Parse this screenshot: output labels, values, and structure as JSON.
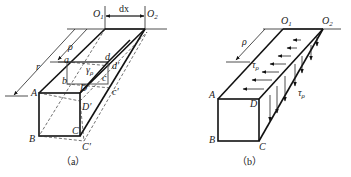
{
  "figure_a": {
    "caption": "（a）",
    "labels": {
      "O1": "O",
      "O1_sub": "1",
      "O2": "O",
      "O2_sub": "2",
      "dx": "dx",
      "r": "r",
      "rho": "ρ",
      "a": "a",
      "d": "d",
      "b": "b",
      "c": "c",
      "d_prime": "d′",
      "c_prime": "c′",
      "gamma": "γ",
      "gamma_sub": "ρ",
      "A": "A",
      "B": "B",
      "C": "C",
      "D": "D",
      "D_prime": "D′",
      "C_prime": "C′"
    }
  },
  "figure_b": {
    "caption": "（b）",
    "labels": {
      "O1": "O",
      "O1_sub": "1",
      "O2": "O",
      "O2_sub": "2",
      "rho": "ρ",
      "tau_top": "τ",
      "tau_top_sub": "ρ",
      "tau_side": "τ",
      "tau_side_sub": "ρ",
      "A": "A",
      "B": "B",
      "C": "C",
      "D": "D"
    }
  }
}
